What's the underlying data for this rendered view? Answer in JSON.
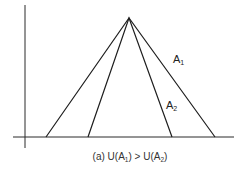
{
  "figure": {
    "colors": {
      "line": "#1e1e1e",
      "axis": "#2a2a2a",
      "background": "#ffffff"
    },
    "axes": {
      "y_axis": {
        "x": 25,
        "y_top": 5,
        "y_bottom": 148
      },
      "x_axis": {
        "y": 137,
        "x_left": 13,
        "x_right": 234
      }
    },
    "apex": {
      "x": 129,
      "y": 18
    },
    "triangles": [
      {
        "name": "A1",
        "left_foot_x": 46,
        "right_foot_x": 215
      },
      {
        "name": "A2",
        "left_foot_x": 88,
        "right_foot_x": 172
      }
    ],
    "labels": {
      "a1": {
        "base": "A",
        "sub": "1"
      },
      "a2": {
        "base": "A",
        "sub": "2"
      }
    },
    "caption": {
      "prefix": "(a) U(A",
      "sub1": "1",
      "middle": ") > U(A",
      "sub2": "2",
      "suffix": ")"
    }
  }
}
